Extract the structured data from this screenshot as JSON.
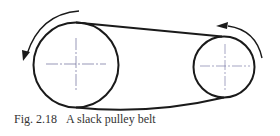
{
  "figure": {
    "caption_number": "Fig. 2.18",
    "caption_text": "A slack pulley belt",
    "colors": {
      "line": "#1a1a1a",
      "centerline": "#6a6a9a"
    }
  }
}
